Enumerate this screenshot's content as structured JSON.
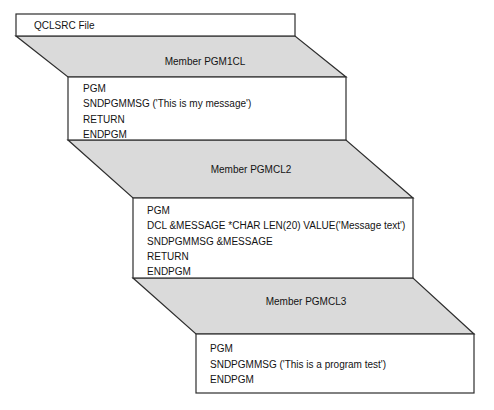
{
  "diagram": {
    "file": {
      "label": "QCLSRC File"
    },
    "members": [
      {
        "label": "Member PGM1CL",
        "lines": [
          "PGM",
          "SNDPGMMSG ('This is my message')",
          "RETURN",
          "ENDPGM"
        ]
      },
      {
        "label": "Member PGMCL2",
        "lines": [
          "PGM",
          "DCL &MESSAGE *CHAR LEN(20) VALUE('Message text')",
          "SNDPGMMSG &MESSAGE",
          "RETURN",
          "ENDPGM"
        ]
      },
      {
        "label": "Member PGMCL3",
        "lines": [
          "PGM",
          "SNDPGMMSG ('This is a program test')",
          "ENDPGM"
        ]
      }
    ]
  },
  "colors": {
    "background": "#ffffff",
    "band_fill": "#dadada",
    "box_fill": "#ffffff",
    "border": "#2e2e2e",
    "text": "#131313"
  }
}
